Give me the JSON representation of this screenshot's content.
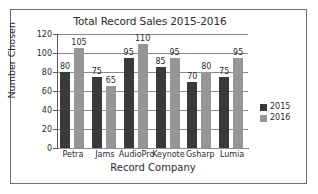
{
  "chart_data": {
    "type": "bar",
    "title": "Total Record Sales 2015-2016",
    "xlabel": "Record Company",
    "ylabel": "Number Chosen",
    "categories": [
      "Petra",
      "Jams",
      "AudioPro",
      "Keynote",
      "Gsharp",
      "Lumia"
    ],
    "series": [
      {
        "name": "2015",
        "color": "#3a3a3a",
        "values": [
          80,
          75,
          95,
          85,
          70,
          75
        ]
      },
      {
        "name": "2016",
        "color": "#969696",
        "values": [
          105,
          65,
          110,
          95,
          80,
          95
        ]
      }
    ],
    "ylim": [
      0,
      120
    ],
    "yticks": [
      0,
      20,
      40,
      60,
      80,
      100,
      120
    ],
    "ytick_labels": [
      "0",
      "20",
      "40",
      "60",
      "80",
      "100",
      "120"
    ],
    "grid": true,
    "legend_position": "right",
    "data_labels": true
  },
  "legend": {
    "entries": [
      {
        "label": "2015",
        "color": "#3a3a3a"
      },
      {
        "label": "2016",
        "color": "#969696"
      }
    ]
  }
}
